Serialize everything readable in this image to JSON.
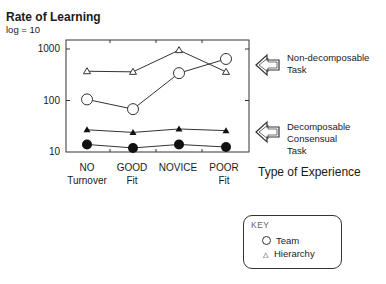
{
  "chart_data": {
    "type": "line",
    "title": "Rate of Learning",
    "subtitle": "log = 10",
    "xlabel": "Type of Experience",
    "ylabel": "Rate of Learning",
    "yscale": "log",
    "ylim": [
      10,
      1500
    ],
    "yticks": [
      "1000",
      "100",
      "10"
    ],
    "categories": [
      "NO Turnover",
      "GOOD Fit",
      "NOVICE",
      "POOR Fit"
    ],
    "category_lines": [
      [
        "NO",
        "Turnover"
      ],
      [
        "GOOD",
        "Fit"
      ],
      [
        "NOVICE"
      ],
      [
        "POOR",
        "Fit"
      ]
    ],
    "series": [
      {
        "name": "Hierarchy (Non-decomposable Task)",
        "marker": "open-triangle",
        "values": [
          370,
          360,
          950,
          360
        ]
      },
      {
        "name": "Team (Non-decomposable Task)",
        "marker": "open-circle",
        "values": [
          105,
          68,
          340,
          640
        ]
      },
      {
        "name": "Hierarchy (Decomposable Consensual Task)",
        "marker": "filled-triangle",
        "values": [
          27,
          24,
          28,
          26
        ]
      },
      {
        "name": "Team (Decomposable Consensual Task)",
        "marker": "filled-circle",
        "values": [
          14,
          12,
          14,
          12.5
        ]
      }
    ],
    "annotations": [
      {
        "text": [
          "Non-decomposable",
          "Task"
        ],
        "arrow": "left"
      },
      {
        "text": [
          "Decomposable",
          "Consensual",
          "Task"
        ],
        "arrow": "left"
      }
    ],
    "legend": {
      "title": "KEY",
      "items": [
        {
          "symbol": "circle",
          "label": "Team"
        },
        {
          "symbol": "triangle",
          "label": "Hierarchy"
        }
      ],
      "position": "bottom-right"
    },
    "grid": false
  }
}
